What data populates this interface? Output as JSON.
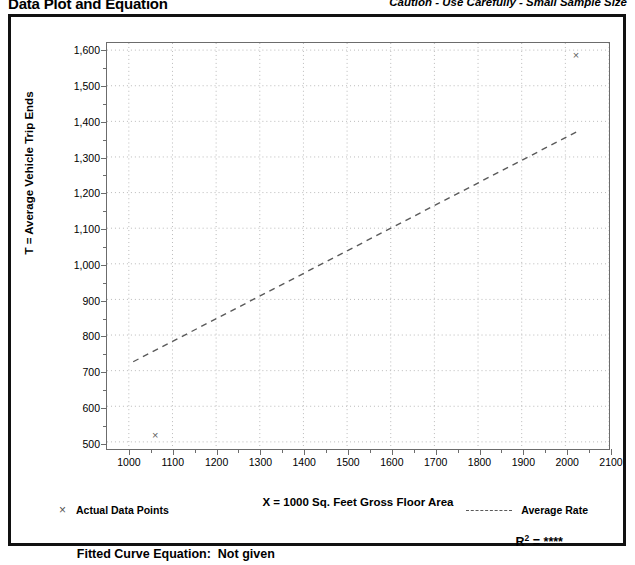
{
  "header": {
    "title": "Data Plot and Equation",
    "caution": "Caution - Use Carefully - Small Sample Size"
  },
  "legend": {
    "actual_marker": "×",
    "actual_label": "Actual Data Points",
    "average_label": "Average Rate"
  },
  "equation": {
    "fitted_label": "Fitted Curve Equation:",
    "fitted_value": "Not given",
    "r_label": "R",
    "r_exponent": "2",
    "r_equals": "=",
    "r_value": "****"
  },
  "chart_data": {
    "type": "scatter",
    "title": "Data Plot and Equation",
    "xlabel": "X = 1000 Sq. Feet Gross Floor Area",
    "ylabel": "T = Average Vehicle Trip Ends",
    "xlim": [
      950,
      2100
    ],
    "ylim": [
      480,
      1620
    ],
    "xticks": [
      1000,
      1100,
      1200,
      1300,
      1400,
      1500,
      1600,
      1700,
      1800,
      1900,
      2000,
      2100
    ],
    "xtick_labels": [
      "1000",
      "1100",
      "1200",
      "1300",
      "1400",
      "1500",
      "1600",
      "1700",
      "1800",
      "1900",
      "2000",
      "2100"
    ],
    "yticks": [
      500,
      600,
      700,
      800,
      900,
      1000,
      1100,
      1200,
      1300,
      1400,
      1500,
      1600
    ],
    "ytick_labels": [
      "500",
      "600",
      "700",
      "800",
      "900",
      "1,000",
      "1,100",
      "1,200",
      "1,300",
      "1,400",
      "1,500",
      "1,600"
    ],
    "grid": "dotted-both",
    "legend_position": "below-plot",
    "series": [
      {
        "name": "Actual Data Points",
        "type": "scatter",
        "marker": "x",
        "color": "#5f5f5f",
        "points": [
          {
            "x": 1060,
            "y": 522
          },
          {
            "x": 2020,
            "y": 1584
          }
        ]
      },
      {
        "name": "Average Rate",
        "type": "line",
        "style": "dashed",
        "color": "#5a5a5a",
        "points": [
          {
            "x": 1010,
            "y": 725
          },
          {
            "x": 2025,
            "y": 1370
          }
        ]
      }
    ],
    "annotations": {
      "r_squared": "****",
      "fitted_curve_equation": "Not given"
    }
  },
  "colors": {
    "frame": "#111111",
    "axis": "#6c6c6c",
    "grid": "#b9b9b9",
    "marker": "#5f5f5f",
    "trend": "#5a5a5a"
  }
}
